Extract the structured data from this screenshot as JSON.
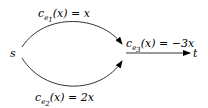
{
  "nodes": {
    "source": "s",
    "sink": "t"
  },
  "edges": [
    {
      "id": "e1",
      "label_pre": "c",
      "label_sub": "e",
      "label_subsub": "1",
      "label_post": "(x) = x"
    },
    {
      "id": "e2",
      "label_pre": "c",
      "label_sub": "e",
      "label_subsub": "2",
      "label_post": "(x) = 2x"
    },
    {
      "id": "e3",
      "label_pre": "c",
      "label_sub": "e",
      "label_subsub": "3",
      "label_post": "(x) = −3x"
    }
  ],
  "colors": {
    "stroke": "#000000",
    "background": "#ffffff"
  }
}
